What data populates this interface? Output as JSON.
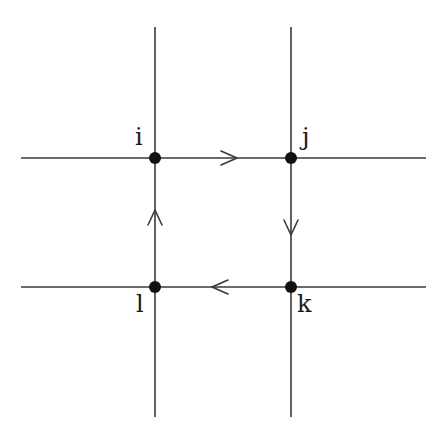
{
  "diagram": {
    "title": "",
    "colors": {
      "line": "#3a3a3a",
      "node": "#111111",
      "label": "#1a1a1a",
      "background": "#ffffff"
    },
    "grid": {
      "vertical_lines": [
        {
          "id": "v-left",
          "x": 155,
          "y1": 27,
          "y2": 417
        },
        {
          "id": "v-right",
          "x": 291,
          "y1": 27,
          "y2": 417
        }
      ],
      "horizontal_lines": [
        {
          "id": "h-top",
          "y": 158,
          "x1": 21,
          "x2": 426
        },
        {
          "id": "h-bottom",
          "y": 287,
          "x1": 21,
          "x2": 426
        }
      ]
    },
    "nodes": [
      {
        "id": "i",
        "label": "i",
        "x": 155,
        "y": 158,
        "label_x": 135,
        "label_y": 145
      },
      {
        "id": "j",
        "label": "j",
        "x": 291,
        "y": 158,
        "label_x": 302,
        "label_y": 145
      },
      {
        "id": "k",
        "label": "k",
        "x": 291,
        "y": 287,
        "label_x": 298,
        "label_y": 312
      },
      {
        "id": "l",
        "label": "l",
        "x": 155,
        "y": 287,
        "label_x": 136,
        "label_y": 312
      }
    ],
    "edges": [
      {
        "from": "i",
        "to": "j",
        "direction": "right",
        "arrow_tip": [
          237,
          158
        ]
      },
      {
        "from": "j",
        "to": "k",
        "direction": "down",
        "arrow_tip": [
          291,
          234
        ]
      },
      {
        "from": "k",
        "to": "l",
        "direction": "left",
        "arrow_tip": [
          212,
          287
        ]
      },
      {
        "from": "l",
        "to": "i",
        "direction": "up",
        "arrow_tip": [
          155,
          210
        ]
      }
    ],
    "labels": {
      "i": "i",
      "j": "j",
      "k": "k",
      "l": "l"
    }
  }
}
